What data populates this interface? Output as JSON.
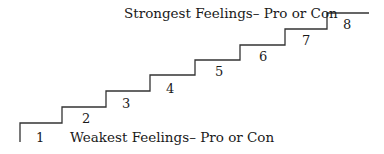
{
  "diagram": {
    "type": "staircase",
    "top_label": "Strongest Feelings– Pro or Con",
    "bottom_label": "Weakest Feelings– Pro or Con",
    "steps": [
      {
        "number": "1"
      },
      {
        "number": "2"
      },
      {
        "number": "3"
      },
      {
        "number": "4"
      },
      {
        "number": "5"
      },
      {
        "number": "6"
      },
      {
        "number": "7"
      },
      {
        "number": "8"
      }
    ],
    "line_color": "#333333"
  }
}
